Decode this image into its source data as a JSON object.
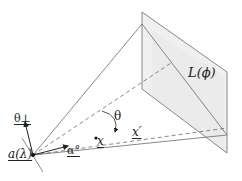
{
  "diagram": {
    "type": "geometry-projection",
    "labels": {
      "plane": "L(ϕ)",
      "angle": "θ",
      "theta_perp": "θ⊥",
      "source": "a(λ)",
      "alpha": "α°",
      "x": "x",
      "x_prime": "x′"
    },
    "colors": {
      "line": "#6a6a6a",
      "plane_fill": "#ececec",
      "text": "#222222"
    }
  }
}
